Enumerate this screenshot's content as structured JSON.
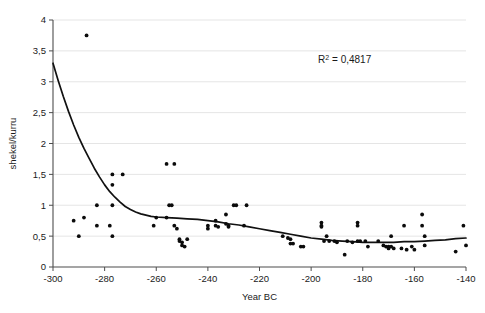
{
  "chart_data": {
    "type": "scatter",
    "title": "",
    "xlabel": "Year BC",
    "ylabel": "shekel/kurru",
    "xlim": [
      -300,
      -140
    ],
    "ylim": [
      0,
      4
    ],
    "grid": true,
    "legend": false,
    "xticks": [
      -300,
      -280,
      -260,
      -240,
      -220,
      -200,
      -180,
      -160,
      -140
    ],
    "xtick_labels": [
      "-300",
      "-280",
      "-260",
      "-240",
      "-220",
      "-200",
      "-180",
      "-160",
      "-140"
    ],
    "yticks": [
      0,
      0.5,
      1,
      1.5,
      2,
      2.5,
      3,
      3.5,
      4
    ],
    "ytick_labels": [
      "0",
      "0,5",
      "1",
      "1,5",
      "2",
      "2,5",
      "3",
      "3,5",
      "4"
    ],
    "annotations": [
      {
        "name": "r-squared-label",
        "text": "R2 = 0,4817",
        "prefix": "R",
        "superscript": "2",
        "suffix": " = 0,4817",
        "x": -187,
        "y": 3.3
      }
    ],
    "series": [
      {
        "name": "shekel per kurru observations",
        "marker": "dot",
        "color": "#0b0b0b",
        "points": [
          [
            -292,
            0.75
          ],
          [
            -290,
            0.5
          ],
          [
            -288,
            0.8
          ],
          [
            -287,
            3.75
          ],
          [
            -283,
            1.0
          ],
          [
            -283,
            0.67
          ],
          [
            -278,
            0.67
          ],
          [
            -277,
            1.5
          ],
          [
            -277,
            1.33
          ],
          [
            -277,
            1.0
          ],
          [
            -277,
            0.5
          ],
          [
            -273,
            1.5
          ],
          [
            -261,
            0.67
          ],
          [
            -260,
            0.8
          ],
          [
            -256,
            1.67
          ],
          [
            -256,
            0.8
          ],
          [
            -255,
            1.0
          ],
          [
            -254,
            1.0
          ],
          [
            -253,
            1.67
          ],
          [
            -253,
            0.67
          ],
          [
            -252,
            0.62
          ],
          [
            -251,
            0.45
          ],
          [
            -251,
            0.42
          ],
          [
            -250,
            0.4
          ],
          [
            -250,
            0.35
          ],
          [
            -249,
            0.33
          ],
          [
            -248,
            0.45
          ],
          [
            -240,
            0.67
          ],
          [
            -240,
            0.62
          ],
          [
            -237,
            0.75
          ],
          [
            -237,
            0.67
          ],
          [
            -236,
            0.65
          ],
          [
            -233,
            0.85
          ],
          [
            -233,
            0.7
          ],
          [
            -232,
            0.67
          ],
          [
            -232,
            0.65
          ],
          [
            -230,
            1.0
          ],
          [
            -229,
            1.0
          ],
          [
            -226,
            0.67
          ],
          [
            -225,
            1.0
          ],
          [
            -211,
            0.5
          ],
          [
            -209,
            0.47
          ],
          [
            -208,
            0.45
          ],
          [
            -208,
            0.38
          ],
          [
            -207,
            0.38
          ],
          [
            -204,
            0.33
          ],
          [
            -203,
            0.33
          ],
          [
            -196,
            0.72
          ],
          [
            -196,
            0.67
          ],
          [
            -196,
            0.65
          ],
          [
            -195,
            0.42
          ],
          [
            -194,
            0.5
          ],
          [
            -193,
            0.42
          ],
          [
            -191,
            0.42
          ],
          [
            -190,
            0.4
          ],
          [
            -187,
            0.2
          ],
          [
            -186,
            0.42
          ],
          [
            -184,
            0.4
          ],
          [
            -182,
            0.72
          ],
          [
            -182,
            0.67
          ],
          [
            -182,
            0.42
          ],
          [
            -181,
            0.42
          ],
          [
            -179,
            0.42
          ],
          [
            -178,
            0.33
          ],
          [
            -174,
            0.42
          ],
          [
            -172,
            0.35
          ],
          [
            -171,
            0.33
          ],
          [
            -170,
            0.33
          ],
          [
            -170,
            0.3
          ],
          [
            -169,
            0.5
          ],
          [
            -169,
            0.33
          ],
          [
            -168,
            0.3
          ],
          [
            -165,
            0.3
          ],
          [
            -164,
            0.67
          ],
          [
            -163,
            0.28
          ],
          [
            -161,
            0.33
          ],
          [
            -160,
            0.28
          ],
          [
            -157,
            0.85
          ],
          [
            -157,
            0.67
          ],
          [
            -156,
            0.5
          ],
          [
            -156,
            0.35
          ],
          [
            -144,
            0.25
          ],
          [
            -141,
            0.67
          ],
          [
            -140,
            0.35
          ]
        ]
      }
    ],
    "trend": {
      "name": "power-law trendline",
      "color": "#111111",
      "points": [
        [
          -300,
          3.3
        ],
        [
          -298,
          3.02
        ],
        [
          -296,
          2.76
        ],
        [
          -294,
          2.52
        ],
        [
          -292,
          2.3
        ],
        [
          -290,
          2.1
        ],
        [
          -288,
          1.92
        ],
        [
          -286,
          1.76
        ],
        [
          -284,
          1.6
        ],
        [
          -282,
          1.46
        ],
        [
          -280,
          1.33
        ],
        [
          -278,
          1.22
        ],
        [
          -276,
          1.13
        ],
        [
          -274,
          1.05
        ],
        [
          -272,
          0.98
        ],
        [
          -270,
          0.93
        ],
        [
          -268,
          0.89
        ],
        [
          -266,
          0.86
        ],
        [
          -264,
          0.84
        ],
        [
          -262,
          0.82
        ],
        [
          -260,
          0.81
        ],
        [
          -256,
          0.8
        ],
        [
          -252,
          0.79
        ],
        [
          -248,
          0.78
        ],
        [
          -244,
          0.77
        ],
        [
          -240,
          0.75
        ],
        [
          -236,
          0.73
        ],
        [
          -232,
          0.7
        ],
        [
          -228,
          0.68
        ],
        [
          -224,
          0.65
        ],
        [
          -220,
          0.62
        ],
        [
          -216,
          0.59
        ],
        [
          -212,
          0.56
        ],
        [
          -208,
          0.53
        ],
        [
          -204,
          0.5
        ],
        [
          -200,
          0.47
        ],
        [
          -196,
          0.45
        ],
        [
          -192,
          0.43
        ],
        [
          -188,
          0.42
        ],
        [
          -184,
          0.41
        ],
        [
          -180,
          0.4
        ],
        [
          -176,
          0.4
        ],
        [
          -172,
          0.4
        ],
        [
          -168,
          0.4
        ],
        [
          -164,
          0.41
        ],
        [
          -160,
          0.41
        ],
        [
          -156,
          0.42
        ],
        [
          -152,
          0.43
        ],
        [
          -148,
          0.44
        ],
        [
          -144,
          0.46
        ],
        [
          -140,
          0.47
        ]
      ]
    }
  }
}
